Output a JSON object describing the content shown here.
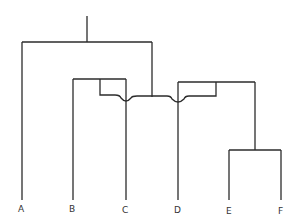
{
  "diagram": {
    "type": "dendrogram",
    "line_color": "#2b2b2b",
    "leaves": [
      {
        "label": "A",
        "x": 21
      },
      {
        "label": "B",
        "x": 72
      },
      {
        "label": "C",
        "x": 125
      },
      {
        "label": "D",
        "x": 177
      },
      {
        "label": "E",
        "x": 229
      },
      {
        "label": "F",
        "x": 281
      }
    ]
  }
}
